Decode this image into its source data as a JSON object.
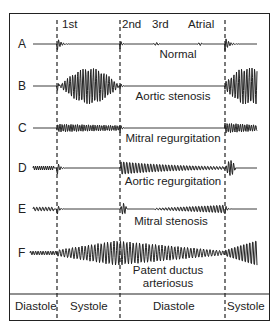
{
  "figure": {
    "sound_labels": {
      "first": "1st",
      "second": "2nd",
      "third": "3rd",
      "atrial": "Atrial"
    },
    "rows": [
      {
        "letter": "A",
        "caption": "Normal",
        "caption_line2": ""
      },
      {
        "letter": "B",
        "caption": "Aortic stenosis",
        "caption_line2": ""
      },
      {
        "letter": "C",
        "caption": "Mitral regurgitation",
        "caption_line2": ""
      },
      {
        "letter": "D",
        "caption": "Aortic regurgitation",
        "caption_line2": ""
      },
      {
        "letter": "E",
        "caption": "Mitral stenosis",
        "caption_line2": ""
      },
      {
        "letter": "F",
        "caption": "Patent ductus",
        "caption_line2": "arteriosus"
      }
    ],
    "phases": [
      "Diastole",
      "Systole",
      "Diastole",
      "Systole"
    ],
    "colors": {
      "line": "#222222",
      "background": "#ffffff"
    }
  }
}
